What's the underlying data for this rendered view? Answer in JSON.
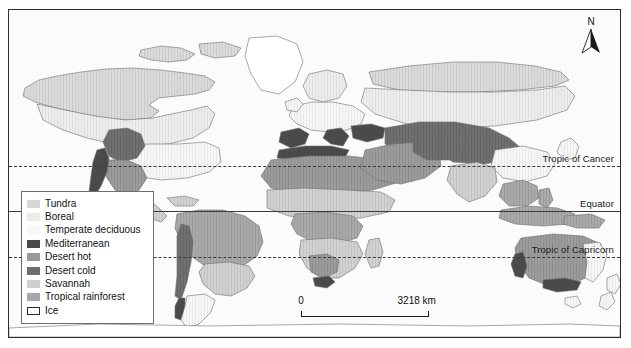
{
  "figure": {
    "background_color": "#ffffff",
    "frame_color": "#2e2e2e",
    "ocean_color": "#fbfbfb",
    "coastline_color": "#6f6f6f"
  },
  "north_arrow": {
    "label": "N",
    "name": "north-arrow"
  },
  "scale_bar": {
    "min_label": "0",
    "max_label": "3218 km",
    "unit": "km",
    "max_value": 3218
  },
  "reference_lines": [
    {
      "id": "tropic-of-cancer",
      "label": "Tropic of Cancer",
      "style": "dashed",
      "y": 156
    },
    {
      "id": "equator",
      "label": "Equator",
      "style": "solid",
      "y": 201
    },
    {
      "id": "tropic-of-capricorn",
      "label": "Tropic of Capricorn",
      "style": "dashed",
      "y": 247
    }
  ],
  "legend": {
    "title": "",
    "items": [
      {
        "label": "Tundra",
        "color": "#d6d6d6",
        "outlined": false
      },
      {
        "label": "Boreal",
        "color": "#ececec",
        "outlined": false
      },
      {
        "label": "Temperate deciduous",
        "color": "#f7f7f7",
        "outlined": false
      },
      {
        "label": "Mediterranean",
        "color": "#4a4a4a",
        "outlined": false
      },
      {
        "label": "Desert hot",
        "color": "#9a9a9a",
        "outlined": false
      },
      {
        "label": "Desert cold",
        "color": "#6e6e6e",
        "outlined": false
      },
      {
        "label": "Savannah",
        "color": "#cfcfcf",
        "outlined": false
      },
      {
        "label": "Tropical rainforest",
        "color": "#a8a8a8",
        "outlined": false
      },
      {
        "label": "Ice",
        "color": "#ffffff",
        "outlined": true
      }
    ]
  }
}
